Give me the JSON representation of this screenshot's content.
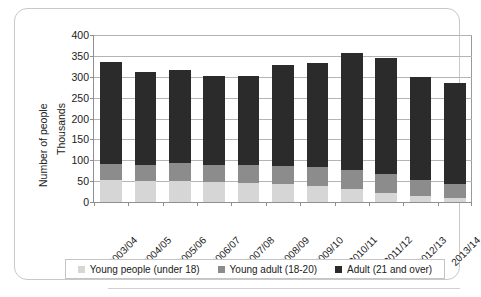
{
  "chart_data": {
    "type": "bar",
    "stacked": true,
    "title": "",
    "xlabel": "",
    "ylabel": "Number of people",
    "ylabel_secondary": "Thousands",
    "ylim": [
      0,
      400
    ],
    "ytick_step": 50,
    "yticks": [
      400,
      350,
      300,
      250,
      200,
      150,
      100,
      50,
      0
    ],
    "grid": true,
    "legend_position": "bottom",
    "categories": [
      "2003/04",
      "2004/05",
      "2005/06",
      "2006/07",
      "2007/08",
      "2008/09",
      "2009/10",
      "2010/11",
      "2011/12",
      "2012/13",
      "2013/14"
    ],
    "series": [
      {
        "name": "Young people (under 18)",
        "color": "#d6d6d6",
        "values": [
          52,
          50,
          50,
          47,
          45,
          42,
          38,
          30,
          22,
          14,
          10
        ]
      },
      {
        "name": "Young adult (18-20)",
        "color": "#8c8c8c",
        "values": [
          39,
          38,
          43,
          41,
          43,
          45,
          45,
          46,
          44,
          38,
          32
        ]
      },
      {
        "name": "Adult (21 and over)",
        "color": "#2b2b2b",
        "values": [
          245,
          223,
          224,
          213,
          215,
          241,
          251,
          282,
          279,
          248,
          243
        ]
      }
    ],
    "totals": [
      336,
      311,
      317,
      301,
      303,
      328,
      334,
      358,
      345,
      300,
      285
    ]
  },
  "legend": {
    "items": [
      {
        "label": "Young people (under 18)"
      },
      {
        "label": "Young adult (18-20)"
      },
      {
        "label": "Adult (21 and over)"
      }
    ]
  }
}
